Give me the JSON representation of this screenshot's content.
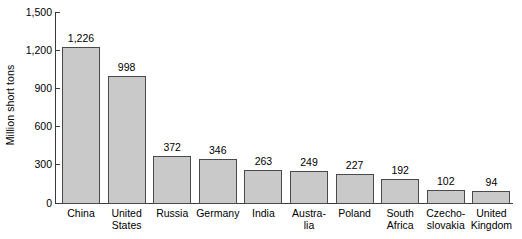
{
  "chart_data": {
    "type": "bar",
    "title": "",
    "xlabel": "",
    "ylabel": "Million short tons",
    "ylim": [
      0,
      1500
    ],
    "yticks": [
      "0",
      "300",
      "600",
      "900",
      "1,200",
      "1,500"
    ],
    "ytick_values": [
      0,
      300,
      600,
      900,
      1200,
      1500
    ],
    "grid": false,
    "legend": null,
    "categories": [
      "China",
      "United States",
      "Russia",
      "Germany",
      "India",
      "Austra-lia",
      "Poland",
      "South Africa",
      "Czecho-slovakia",
      "United Kingdom"
    ],
    "category_lines": [
      [
        "China"
      ],
      [
        "United",
        "States"
      ],
      [
        "Russia"
      ],
      [
        "Germany"
      ],
      [
        "India"
      ],
      [
        "Austra-",
        "lia"
      ],
      [
        "Poland"
      ],
      [
        "South",
        "Africa"
      ],
      [
        "Czecho-",
        "slovakia"
      ],
      [
        "United",
        "Kingdom"
      ]
    ],
    "values": [
      1226,
      998,
      372,
      346,
      263,
      249,
      227,
      192,
      102,
      94
    ],
    "value_labels": [
      "1,226",
      "998",
      "372",
      "346",
      "263",
      "249",
      "227",
      "192",
      "102",
      "94"
    ],
    "bar_fill_color": "#c9c9c9",
    "bar_border_color": "#4a4a4a",
    "axis_color": "#3a3a3a"
  }
}
